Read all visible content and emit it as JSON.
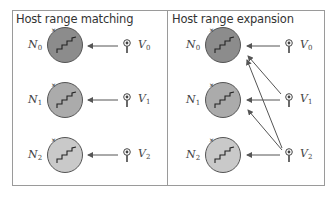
{
  "panels": [
    {
      "title": "Host range matching",
      "hosts": [
        {
          "label": "N",
          "sub": "0",
          "fill": "#8c8c8c"
        },
        {
          "label": "N",
          "sub": "1",
          "fill": "#ababab"
        },
        {
          "label": "N",
          "sub": "2",
          "fill": "#c9c9c9"
        }
      ],
      "viruses": [
        {
          "label": "V",
          "sub": "0"
        },
        {
          "label": "V",
          "sub": "1"
        },
        {
          "label": "V",
          "sub": "2"
        }
      ],
      "arrows": [
        {
          "from": "V0",
          "to": "N0"
        },
        {
          "from": "V1",
          "to": "N1"
        },
        {
          "from": "V2",
          "to": "N2"
        }
      ]
    },
    {
      "title": "Host range expansion",
      "hosts": [
        {
          "label": "N",
          "sub": "0",
          "fill": "#8c8c8c"
        },
        {
          "label": "N",
          "sub": "1",
          "fill": "#ababab"
        },
        {
          "label": "N",
          "sub": "2",
          "fill": "#c9c9c9"
        }
      ],
      "viruses": [
        {
          "label": "V",
          "sub": "0"
        },
        {
          "label": "V",
          "sub": "1"
        },
        {
          "label": "V",
          "sub": "2"
        }
      ],
      "arrows": [
        {
          "from": "V0",
          "to": "N0"
        },
        {
          "from": "V1",
          "to": "N0"
        },
        {
          "from": "V1",
          "to": "N1"
        },
        {
          "from": "V2",
          "to": "N0"
        },
        {
          "from": "V2",
          "to": "N1"
        },
        {
          "from": "V2",
          "to": "N2"
        }
      ]
    }
  ],
  "colors": {
    "frame": "#9a9a9a",
    "arrow": "#555555",
    "circle_stroke": "#555555"
  }
}
